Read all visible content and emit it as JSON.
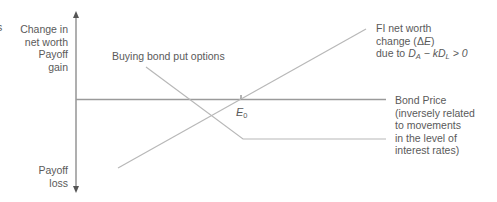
{
  "diagram": {
    "edge_fragment": "s",
    "y_axis": {
      "top_label_lines": [
        "Change in",
        "net worth",
        "Payoff",
        "gain"
      ],
      "bottom_label_lines": [
        "Payoff",
        "loss"
      ]
    },
    "x_axis": {
      "label_lines": [
        "Bond Price",
        "(inversely related",
        "to movements",
        "in the level of",
        "interest rates)"
      ],
      "tick_label_main": "E",
      "tick_label_sub": "0"
    },
    "put_line": {
      "label": "Buying bond put options"
    },
    "net_worth_line": {
      "label_line1": "FI net worth",
      "label_line2_prefix": "change (",
      "label_line2_delta": "Δ",
      "label_line2_var": "E",
      "label_line2_suffix": ")",
      "label_line3_prefix": "due to ",
      "label_line3_DA": "D",
      "label_line3_DA_sub": "A",
      "label_line3_minus": " − ",
      "label_line3_k": "kD",
      "label_line3_DL_sub": "L",
      "label_line3_tail": " > 0"
    },
    "colors": {
      "axis": "#7a7a7a",
      "lines": "#b5b5b5",
      "text": "#5a5a5a"
    }
  }
}
